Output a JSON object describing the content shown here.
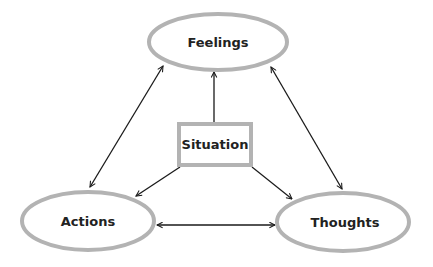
{
  "diagram": {
    "type": "cognitive-triangle",
    "colors": {
      "node_stroke": "#b3b3b3",
      "node_fill": "#ffffff",
      "edge": "#1a1a1a",
      "text": "#222222"
    },
    "nodes": {
      "feelings": {
        "label": "Feelings",
        "shape": "ellipse"
      },
      "situation": {
        "label": "Situation",
        "shape": "rectangle"
      },
      "actions": {
        "label": "Actions",
        "shape": "ellipse"
      },
      "thoughts": {
        "label": "Thoughts",
        "shape": "ellipse"
      }
    },
    "edges": [
      {
        "from": "situation",
        "to": "feelings",
        "direction": "one-way"
      },
      {
        "from": "situation",
        "to": "actions",
        "direction": "one-way"
      },
      {
        "from": "situation",
        "to": "thoughts",
        "direction": "one-way"
      },
      {
        "from": "feelings",
        "to": "actions",
        "direction": "two-way"
      },
      {
        "from": "feelings",
        "to": "thoughts",
        "direction": "two-way"
      },
      {
        "from": "actions",
        "to": "thoughts",
        "direction": "two-way"
      }
    ]
  }
}
